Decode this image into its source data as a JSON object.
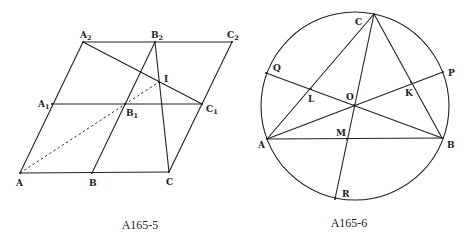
{
  "figures": [
    {
      "caption": "A165-5",
      "points": [
        {
          "id": "A",
          "base": "A",
          "sub": ""
        },
        {
          "id": "B",
          "base": "B",
          "sub": ""
        },
        {
          "id": "C",
          "base": "C",
          "sub": ""
        },
        {
          "id": "A1",
          "base": "A",
          "sub": "1"
        },
        {
          "id": "B1",
          "base": "B",
          "sub": "1"
        },
        {
          "id": "C1",
          "base": "C",
          "sub": "1"
        },
        {
          "id": "A2",
          "base": "A",
          "sub": "2"
        },
        {
          "id": "B2",
          "base": "B",
          "sub": "2"
        },
        {
          "id": "C2",
          "base": "C",
          "sub": "2"
        },
        {
          "id": "I",
          "base": "I",
          "sub": ""
        }
      ],
      "segments": [
        [
          "A",
          "C"
        ],
        [
          "A1",
          "C1"
        ],
        [
          "A2",
          "C2"
        ],
        [
          "A",
          "A2"
        ],
        [
          "B",
          "B2"
        ],
        [
          "C",
          "C2"
        ],
        [
          "A2",
          "C1"
        ],
        [
          "B2",
          "C"
        ]
      ],
      "dashed_segments": [
        [
          "A",
          "I"
        ]
      ]
    },
    {
      "caption": "A165-6",
      "shape": "circle",
      "points": [
        {
          "id": "A",
          "base": "A"
        },
        {
          "id": "B",
          "base": "B"
        },
        {
          "id": "C",
          "base": "C"
        },
        {
          "id": "P",
          "base": "P"
        },
        {
          "id": "Q",
          "base": "Q"
        },
        {
          "id": "R",
          "base": "R"
        },
        {
          "id": "O",
          "base": "O"
        },
        {
          "id": "L",
          "base": "L"
        },
        {
          "id": "K",
          "base": "K"
        },
        {
          "id": "M",
          "base": "M"
        }
      ],
      "segments": [
        [
          "A",
          "B"
        ],
        [
          "B",
          "C"
        ],
        [
          "C",
          "A"
        ],
        [
          "A",
          "P"
        ],
        [
          "B",
          "Q"
        ],
        [
          "C",
          "R"
        ]
      ]
    }
  ]
}
